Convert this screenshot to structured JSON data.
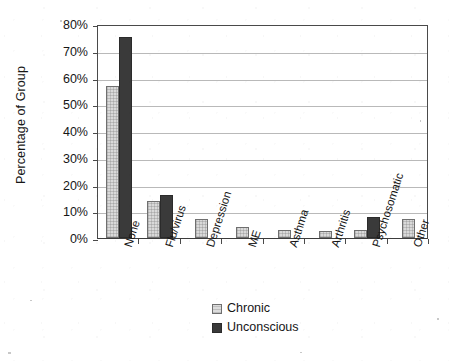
{
  "chart_data": {
    "type": "bar",
    "title": "",
    "xlabel": "",
    "ylabel": "Percentage of Group",
    "ylim": [
      0,
      80
    ],
    "ytick_labels": [
      "0%",
      "10%",
      "20%",
      "30%",
      "40%",
      "50%",
      "60%",
      "70%",
      "80%"
    ],
    "ytick_values": [
      0,
      10,
      20,
      30,
      40,
      50,
      60,
      70,
      80
    ],
    "grid": "horizontal",
    "legend_position": "bottom-center",
    "categories": [
      "None",
      "Flu/virus",
      "Depression",
      "ME",
      "Asthma",
      "Arthritis",
      "Psychosomatic",
      "Other"
    ],
    "series": [
      {
        "name": "Chronic",
        "color": "#d9d9d9",
        "values": [
          57,
          14,
          7,
          4,
          3,
          2.5,
          3,
          7
        ]
      },
      {
        "name": "Unconscious",
        "color": "#3a3a3a",
        "values": [
          75,
          16,
          0,
          0,
          0,
          0,
          8,
          0
        ]
      }
    ]
  },
  "legend": {
    "items": [
      {
        "label": "Chronic"
      },
      {
        "label": "Unconscious"
      }
    ]
  }
}
